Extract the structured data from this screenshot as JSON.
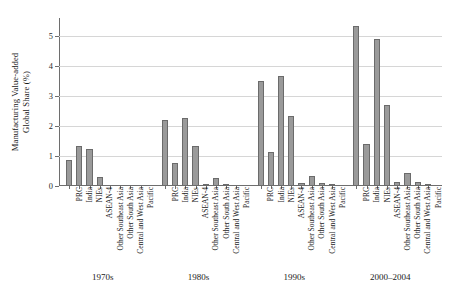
{
  "figure": {
    "top_artifact_text": "ﾠ"
  },
  "axis": {
    "ylabel_line1": "Manufacturing Value-added",
    "ylabel_line2": "Global Share (%)",
    "yticks": [
      "0",
      "1",
      "2",
      "3",
      "4",
      "5"
    ]
  },
  "chart_data": {
    "type": "bar",
    "title": "",
    "subtitle": "",
    "xlabel": "",
    "ylabel": "Manufacturing Value-added Global Share (%)",
    "ylim": [
      0,
      5.6
    ],
    "yticks": [
      0,
      1,
      2,
      3,
      4,
      5
    ],
    "grid": true,
    "legend": "none",
    "bar_color": "#9a9a9a",
    "bar_edge_color": "#6b6b6b",
    "categories": [
      "PRC",
      "India",
      "NIEs",
      "ASEAN-4",
      "Other Southeast Asia",
      "Other South Asia",
      "Central and West Asia",
      "Pacific"
    ],
    "groups": [
      {
        "label": "1970s",
        "values": [
          0.88,
          1.35,
          1.25,
          0.3,
          0.0,
          0.0,
          0.0,
          0.0
        ]
      },
      {
        "label": "1980s",
        "values": [
          2.2,
          0.78,
          2.28,
          1.33,
          0.08,
          0.27,
          0.03,
          0.0
        ]
      },
      {
        "label": "1990s",
        "values": [
          3.5,
          1.13,
          3.68,
          2.35,
          0.1,
          0.35,
          0.1,
          0.03
        ]
      },
      {
        "label": "2000–2004",
        "values": [
          5.35,
          1.4,
          4.9,
          2.7,
          0.15,
          0.45,
          0.12,
          0.03
        ]
      }
    ]
  }
}
